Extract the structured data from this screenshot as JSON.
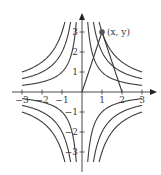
{
  "figure": {
    "origin_px": [
      82,
      92
    ],
    "unit_px": 20,
    "x_ticks": [
      {
        "value": -3,
        "label": "−3"
      },
      {
        "value": -2,
        "label": "−2"
      },
      {
        "value": -1,
        "label": "−1"
      },
      {
        "value": 1,
        "label": "1"
      },
      {
        "value": 2,
        "label": "2"
      },
      {
        "value": 3,
        "label": "3"
      }
    ],
    "y_ticks": [
      {
        "value": 3,
        "label": "3"
      },
      {
        "value": 2,
        "label": "2"
      },
      {
        "value": 1,
        "label": "1"
      },
      {
        "value": -1,
        "label": "−1"
      },
      {
        "value": -2,
        "label": "−2"
      },
      {
        "value": -3,
        "label": "−3"
      }
    ],
    "curves_c": [
      1,
      2,
      3
    ],
    "point": {
      "x": 1,
      "y": 3,
      "label": "(x, y)"
    },
    "segments": [
      {
        "from": [
          0,
          0
        ],
        "to": [
          1,
          3
        ]
      },
      {
        "from": [
          1,
          3
        ],
        "to": [
          2,
          0
        ]
      }
    ]
  }
}
